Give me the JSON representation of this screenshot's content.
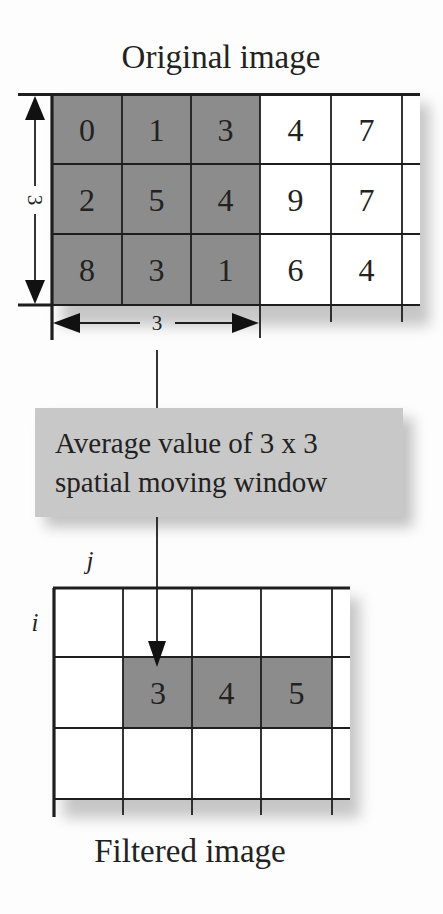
{
  "original": {
    "title": "Original image",
    "rows": [
      [
        "0",
        "1",
        "3",
        "4",
        "7"
      ],
      [
        "2",
        "5",
        "4",
        "9",
        "7"
      ],
      [
        "8",
        "3",
        "1",
        "6",
        "4"
      ]
    ],
    "window_height_label": "3",
    "window_width_label": "3"
  },
  "operation": {
    "line1": "Average value of 3 x 3",
    "line2": "spatial moving window"
  },
  "filtered": {
    "title": "Filtered image",
    "axis_j": "j",
    "axis_i": "i",
    "row2_values": [
      "3",
      "4",
      "5"
    ]
  },
  "colors": {
    "window_fill": "#8c8c8c",
    "box_fill": "#c8c8c8",
    "line": "#1e1e1e",
    "background": "#fdfdfd"
  }
}
